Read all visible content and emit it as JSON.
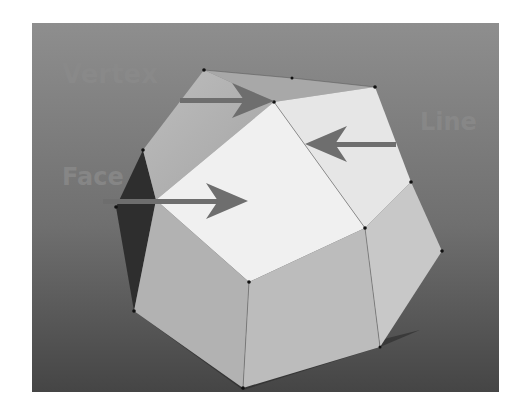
{
  "diagram": {
    "labels": {
      "vertex": "Vertex",
      "line": "Line",
      "face": "Face"
    },
    "colors": {
      "background_top": "#8c8c8c",
      "background_bottom": "#4a4a4a",
      "face_highlight": "#f2f2f2",
      "face_mid": "#b4b4b4",
      "face_light_gray": "#c4c4c4",
      "face_dark": "#2e2e2e",
      "arrow": "#6e6e6e",
      "label": "#8a8a8a",
      "vertex_dot": "#111111"
    }
  }
}
